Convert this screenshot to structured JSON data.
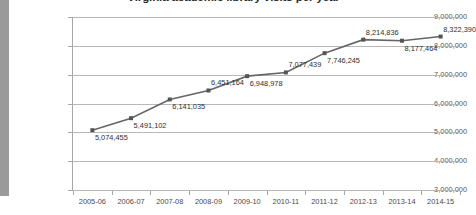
{
  "chart_data": {
    "type": "line",
    "title": "Virginia academic library visits per year",
    "xlabel": "",
    "ylabel": "",
    "categories": [
      "2005-06",
      "2006-07",
      "2007-08",
      "2008-09",
      "2009-10",
      "2010-11",
      "2011-12",
      "2012-13",
      "2013-14",
      "2014-15"
    ],
    "values": [
      5074455,
      5491102,
      6141035,
      6451164,
      6948978,
      7077439,
      7746245,
      8214836,
      8177464,
      8322390
    ],
    "data_labels": [
      "5,074,455",
      "5,491,102",
      "6,141,035",
      "6,451,164",
      "6,948,978",
      "7,077,439",
      "7,746,245",
      "8,214,836",
      "8,177,464",
      "8,322,390"
    ],
    "ylim": [
      3000000,
      9000000
    ],
    "ytick_labels": [
      "9,000,000",
      "8,000,000",
      "7,000,000",
      "6,000,000",
      "5,000,000",
      "4,000,000",
      "3,000,000"
    ],
    "ytick_values": [
      9000000,
      8000000,
      7000000,
      6000000,
      5000000,
      4000000,
      3000000
    ],
    "grid": true,
    "legend": false,
    "series_color": "#666666",
    "marker": "square",
    "marker_color": "#555555",
    "gridline_color": "#b8b8b8",
    "label_positions": [
      "below",
      "below",
      "below",
      "above",
      "below",
      "above",
      "below",
      "above",
      "below",
      "above"
    ]
  }
}
